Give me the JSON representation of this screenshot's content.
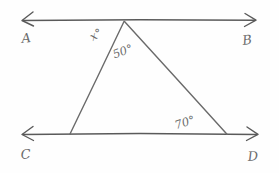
{
  "figure": {
    "ink_color": "#5a5a5a",
    "background": "#fefefe"
  },
  "points": {
    "A": {
      "label": "A",
      "x": 22,
      "y": 43
    },
    "B": {
      "label": "B",
      "x": 243,
      "y": 45
    },
    "C": {
      "label": "C",
      "x": 21,
      "y": 159
    },
    "D": {
      "label": "D",
      "x": 248,
      "y": 161
    }
  },
  "lines": {
    "AB": {
      "name": "line-ab",
      "x1": 23,
      "y1": 20,
      "x2": 255,
      "y2": 20
    },
    "CD": {
      "name": "line-cd",
      "x1": 23,
      "y1": 134,
      "x2": 257,
      "y2": 134
    }
  },
  "triangle": {
    "apex": {
      "x": 124,
      "y": 21
    },
    "left_vertex": {
      "x": 70,
      "y": 134
    },
    "right_vertex": {
      "x": 227,
      "y": 134
    }
  },
  "angles": [
    {
      "name": "angle-x",
      "label": "x°",
      "x": 98,
      "y": 38,
      "rotate": -32
    },
    {
      "name": "angle-50",
      "label": "50°",
      "x": 124,
      "y": 55,
      "rotate": -20
    },
    {
      "name": "angle-70",
      "label": "70°",
      "x": 186,
      "y": 126,
      "rotate": -18
    }
  ]
}
